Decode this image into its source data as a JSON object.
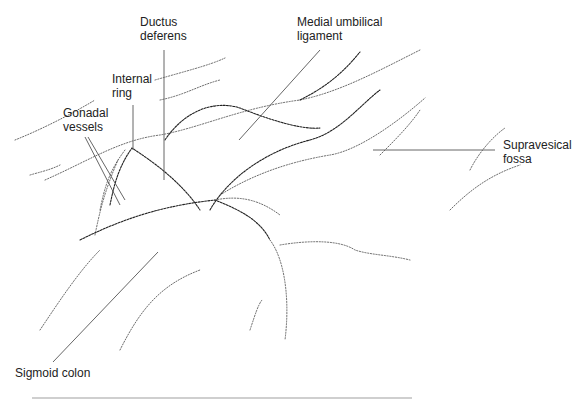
{
  "figure": {
    "type": "anatomical line drawing (laparoscopic view of pelvis)",
    "labels": [
      {
        "id": "ductus-deferens",
        "text": "Ductus\ndeferens",
        "x": 140,
        "y": 15
      },
      {
        "id": "medial-umbilical-ligament",
        "text": "Medial umbilical\nligament",
        "x": 297,
        "y": 15
      },
      {
        "id": "internal-ring",
        "text": "Internal\nring",
        "x": 112,
        "y": 72
      },
      {
        "id": "gonadal-vessels",
        "text": "Gonadal\nvessels",
        "x": 63,
        "y": 106
      },
      {
        "id": "supravesical-fossa",
        "text": "Supravesical\nfossa",
        "x": 503,
        "y": 138
      },
      {
        "id": "sigmoid-colon",
        "text": "Sigmoid colon",
        "x": 15,
        "y": 366
      }
    ],
    "colors": {
      "ink": "#222222",
      "leader": "#555555",
      "background": "#ffffff"
    }
  }
}
